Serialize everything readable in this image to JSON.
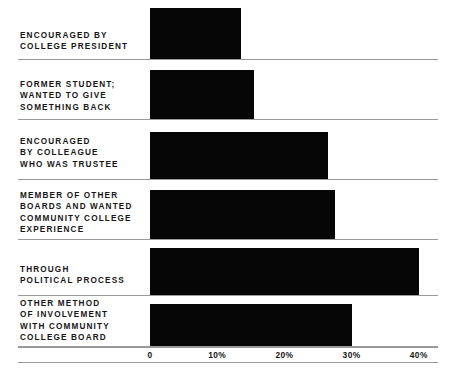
{
  "chart_data": {
    "type": "bar",
    "orientation": "horizontal",
    "title": "",
    "xlabel": "",
    "ylabel": "",
    "xlim": [
      0,
      40
    ],
    "grid": false,
    "legend": false,
    "tick_labels": [
      "0",
      "10%",
      "20%",
      "30%",
      "40%"
    ],
    "tick_values": [
      0,
      10,
      20,
      30,
      40
    ],
    "categories": [
      "ENCOURAGED BY\nCOLLEGE PRESIDENT",
      "FORMER STUDENT;\nWANTED TO GIVE\nSOMETHING BACK",
      "ENCOURAGED\nBY COLLEAGUE\nWHO WAS TRUSTEE",
      "MEMBER OF OTHER\nBOARDS AND WANTED\nCOMMUNITY COLLEGE\nEXPERIENCE",
      "THROUGH\nPOLITICAL PROCESS",
      "OTHER METHOD\nOF INVOLVEMENT\nWITH COMMUNITY\nCOLLEGE BOARD"
    ],
    "values": [
      13.5,
      15.5,
      26.5,
      27.5,
      40,
      30
    ],
    "bar_color": "#050505",
    "rule_color": "#9a9a9a",
    "background": "#ffffff"
  },
  "axis": {
    "ticks": [
      {
        "label": "0",
        "value": 0
      },
      {
        "label": "10%",
        "value": 10
      },
      {
        "label": "20%",
        "value": 20
      },
      {
        "label": "30%",
        "value": 30
      },
      {
        "label": "40%",
        "value": 40
      }
    ]
  },
  "rows": [
    {
      "label": "ENCOURAGED BY\nCOLLEGE PRESIDENT",
      "value": 13.5
    },
    {
      "label": "FORMER STUDENT;\nWANTED TO GIVE\nSOMETHING BACK",
      "value": 15.5
    },
    {
      "label": "ENCOURAGED\nBY COLLEAGUE\nWHO WAS TRUSTEE",
      "value": 26.5
    },
    {
      "label": "MEMBER OF OTHER\nBOARDS AND WANTED\nCOMMUNITY COLLEGE\nEXPERIENCE",
      "value": 27.5
    },
    {
      "label": "THROUGH\nPOLITICAL PROCESS",
      "value": 40
    },
    {
      "label": "OTHER METHOD\nOF INVOLVEMENT\nWITH COMMUNITY\nCOLLEGE BOARD",
      "value": 30
    }
  ]
}
